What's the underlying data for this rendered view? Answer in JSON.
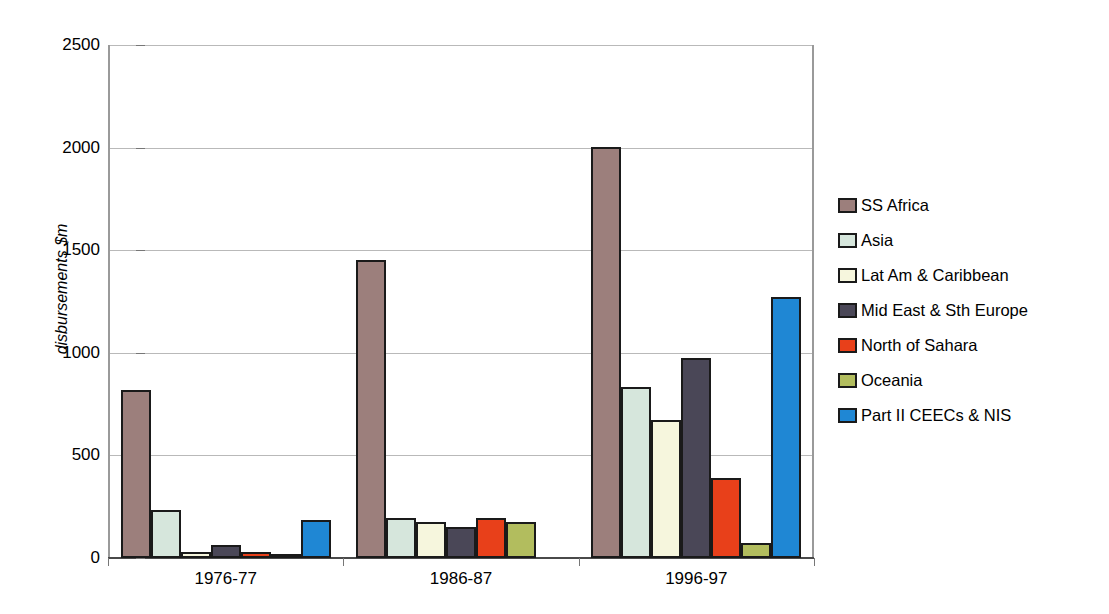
{
  "chart_data": {
    "type": "bar",
    "title": "(1976-77, average of 1986-87 and 1987-88, 1996-97 in $m prices)",
    "xlabel": "",
    "ylabel": "disbursements $m",
    "ylim": [
      0,
      2500
    ],
    "yticks": [
      0,
      500,
      1000,
      1500,
      2000,
      2500
    ],
    "ytick_labels": [
      "0",
      "500",
      "1000",
      "1500",
      "2000",
      "2500"
    ],
    "grid": true,
    "legend_position": "right",
    "categories": [
      "1976-77",
      "1986-87",
      "1996-97"
    ],
    "series": [
      {
        "name": "SS Africa",
        "color": "#9c7f7c",
        "values": [
          818,
          1452,
          2005
        ]
      },
      {
        "name": "Asia",
        "color": "#d6e6dc",
        "values": [
          234,
          195,
          833
        ]
      },
      {
        "name": "Lat Am & Caribbean",
        "color": "#f6f6dd",
        "values": [
          30,
          175,
          672
        ]
      },
      {
        "name": "Mid East & Sth Europe",
        "color": "#4a4757",
        "values": [
          63,
          151,
          975
        ]
      },
      {
        "name": "North of Sahara",
        "color": "#e8401a",
        "values": [
          29,
          195,
          390
        ]
      },
      {
        "name": "Oceania",
        "color": "#b2bd5e",
        "values": [
          10,
          175,
          73
        ]
      },
      {
        "name": "Part II CEECs & NIS",
        "color": "#1f87d4",
        "values": [
          186,
          0,
          1272
        ]
      }
    ]
  }
}
